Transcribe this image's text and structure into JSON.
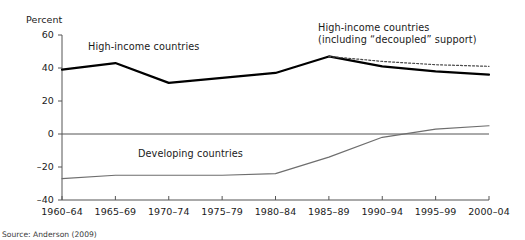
{
  "figure": {
    "y_unit_caption": "Percent",
    "source_note": "Source: Anderson (2009)"
  },
  "labels": {
    "high_income": "High-income countries",
    "decoupled_line1": "High-income countries",
    "decoupled_line2": "(including “decoupled” support)",
    "developing": "Developing countries"
  },
  "colors": {
    "high_income": "#000000",
    "decoupled": "#4a4a4a",
    "developing": "#6e6e6e",
    "axis": "#555555",
    "zero_line": "#555555",
    "text": "#1a1a1a"
  },
  "chart_data": {
    "type": "line",
    "title": "",
    "xlabel": "",
    "ylabel": "Percent",
    "ylim": [
      -40,
      60
    ],
    "yticks": [
      -40,
      -20,
      0,
      20,
      40,
      60
    ],
    "ytick_labels": [
      "–40",
      "–20",
      "0",
      "20",
      "40",
      "60"
    ],
    "grid": false,
    "legend": "none (series labelled in-plot)",
    "categories": [
      "1960–64",
      "1965–69",
      "1970–74",
      "1975–79",
      "1980–84",
      "1985–89",
      "1990–94",
      "1995–99",
      "2000–04"
    ],
    "series": [
      {
        "name": "High-income countries",
        "style": "solid",
        "values": [
          39,
          43,
          31,
          34,
          37,
          47,
          41,
          38,
          36
        ]
      },
      {
        "name": "High-income countries (including “decoupled” support)",
        "style": "dotted",
        "values": [
          null,
          null,
          null,
          null,
          null,
          47,
          44,
          42,
          41
        ]
      },
      {
        "name": "Developing countries",
        "style": "solid-thin",
        "values": [
          -27,
          -25,
          -25,
          -25,
          -24,
          -14,
          -2,
          3,
          5
        ]
      }
    ],
    "zero_reference_line": 0
  }
}
